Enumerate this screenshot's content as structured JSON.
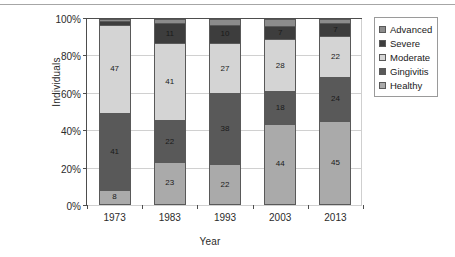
{
  "chart_data": {
    "type": "bar",
    "title": "",
    "xlabel": "Year",
    "ylabel": "Individuals",
    "categories": [
      "1973",
      "1983",
      "1993",
      "2003",
      "2013"
    ],
    "ytick_labels": [
      "0%",
      "20%",
      "40%",
      "60%",
      "80%",
      "100%"
    ],
    "ylim": [
      0,
      100
    ],
    "grid": true,
    "stacked": true,
    "normalized_percent": true,
    "legend_position": "right",
    "series": [
      {
        "name": "Healthy",
        "color": "#aaaaaa",
        "values": [
          8,
          23,
          22,
          44,
          45
        ]
      },
      {
        "name": "Gingivitis",
        "color": "#595959",
        "values": [
          41,
          22,
          38,
          18,
          24
        ]
      },
      {
        "name": "Moderate",
        "color": "#d4d4d4",
        "values": [
          47,
          41,
          27,
          28,
          22
        ]
      },
      {
        "name": "Severe",
        "color": "#3d3d3d",
        "values": [
          2,
          11,
          10,
          7,
          7
        ]
      },
      {
        "name": "Advanced",
        "color": "#8c8c8c",
        "values": [
          1,
          2,
          3,
          4,
          2
        ]
      }
    ],
    "legend_order": [
      "Advanced",
      "Severe",
      "Moderate",
      "Gingivitis",
      "Healthy"
    ]
  }
}
